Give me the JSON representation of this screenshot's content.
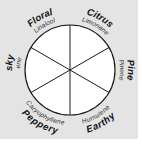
{
  "diagram": {
    "colors": {
      "background": "#e4e4e4",
      "wheel_fill": "#ffffff",
      "stroke": "#1a1a1a"
    },
    "segments": [
      {
        "category": "Citrus",
        "compound": "Limonene"
      },
      {
        "category": "Pine",
        "compound": "Pinene"
      },
      {
        "category": "Earthy",
        "compound": "Humulene"
      },
      {
        "category": "Peppery",
        "compound": "Caryophyllene"
      },
      {
        "category": "Musky",
        "compound": "Myrcene"
      },
      {
        "category": "Floral",
        "compound": "Linalool"
      }
    ]
  }
}
